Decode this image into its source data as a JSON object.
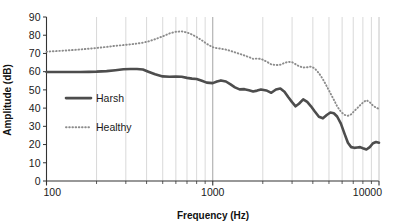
{
  "chart_data": {
    "type": "line",
    "title": "",
    "xlabel": "Frequency (Hz)",
    "ylabel": "Amplitude (dB)",
    "xscale": "log",
    "xlim": [
      100,
      10000
    ],
    "ylim": [
      0,
      90
    ],
    "ytick_step": 10,
    "yticks": [
      "0",
      "10",
      "20",
      "30",
      "40",
      "50",
      "60",
      "70",
      "80",
      "90"
    ],
    "xticks": [
      "100",
      "1000",
      "10000"
    ],
    "grid": "vertical-log-minor",
    "legend_position": "inside-left-middle",
    "series": [
      {
        "name": "Harsh",
        "style": "solid",
        "color": "#4d4d4d",
        "width": 2.6,
        "x": [
          100,
          120,
          140,
          160,
          180,
          200,
          230,
          260,
          290,
          320,
          350,
          380,
          410,
          450,
          500,
          550,
          600,
          650,
          700,
          750,
          800,
          860,
          920,
          1000,
          1060,
          1120,
          1200,
          1280,
          1360,
          1450,
          1550,
          1650,
          1750,
          1850,
          1950,
          2100,
          2250,
          2400,
          2550,
          2700,
          2850,
          3000,
          3150,
          3300,
          3500,
          3700,
          3900,
          4100,
          4350,
          4600,
          4850,
          5100,
          5350,
          5600,
          5900,
          6200,
          6500,
          6800,
          7100,
          7400,
          7700,
          8000,
          8400,
          8800,
          9200,
          9600,
          10000
        ],
        "y": [
          59.8,
          59.8,
          59.8,
          59.8,
          59.9,
          60.0,
          60.3,
          60.8,
          61.3,
          61.5,
          61.5,
          61.2,
          60.0,
          58.6,
          57.4,
          57.2,
          57.3,
          57.2,
          56.6,
          56.2,
          56.0,
          55.0,
          54.0,
          53.7,
          54.6,
          55.2,
          54.6,
          53.0,
          51.4,
          50.3,
          50.4,
          49.8,
          49.1,
          49.6,
          50.2,
          49.7,
          48.4,
          50.2,
          50.8,
          49.0,
          46.0,
          43.3,
          41.0,
          42.4,
          44.8,
          43.4,
          41.0,
          38.3,
          35.3,
          34.4,
          36.2,
          37.6,
          37.2,
          35.4,
          31.5,
          26.0,
          21.0,
          18.6,
          18.2,
          18.4,
          18.6,
          18.0,
          17.3,
          18.6,
          20.7,
          21.4,
          21.0
        ],
        "description": "Harsh voice spectrum, falls from ~60 dB at 100 Hz to ~18-21 dB above 6 kHz"
      },
      {
        "name": "Healthy",
        "style": "dotted",
        "color": "#8c8c8c",
        "width": 1.9,
        "x": [
          100,
          120,
          140,
          160,
          180,
          200,
          230,
          260,
          290,
          320,
          350,
          380,
          410,
          450,
          500,
          550,
          600,
          650,
          700,
          750,
          800,
          860,
          920,
          1000,
          1060,
          1120,
          1200,
          1280,
          1360,
          1450,
          1550,
          1650,
          1750,
          1850,
          1950,
          2100,
          2250,
          2400,
          2550,
          2700,
          2850,
          3000,
          3150,
          3300,
          3500,
          3700,
          3900,
          4100,
          4350,
          4600,
          4850,
          5100,
          5350,
          5600,
          5900,
          6200,
          6500,
          6800,
          7100,
          7400,
          7700,
          8000,
          8400,
          8800,
          9200,
          9600,
          10000
        ],
        "y": [
          71.0,
          71.4,
          71.8,
          72.2,
          72.6,
          73.0,
          73.6,
          74.2,
          74.6,
          75.0,
          75.4,
          75.9,
          76.6,
          77.8,
          79.4,
          81.0,
          81.9,
          82.1,
          81.5,
          80.4,
          79.0,
          77.2,
          75.3,
          73.4,
          72.9,
          72.6,
          72.1,
          71.4,
          70.6,
          69.8,
          68.9,
          68.0,
          67.0,
          67.2,
          67.0,
          65.6,
          64.0,
          63.6,
          63.8,
          64.8,
          65.4,
          65.2,
          64.1,
          63.0,
          62.3,
          62.4,
          62.8,
          61.8,
          59.2,
          55.8,
          52.0,
          48.2,
          44.6,
          41.0,
          38.0,
          36.3,
          35.8,
          36.6,
          38.4,
          40.0,
          41.6,
          43.0,
          44.4,
          43.2,
          41.4,
          40.2,
          39.6
        ],
        "description": "Healthy voice spectrum, peaks ~82 dB near 650 Hz, dips to ~36 dB near 6.5 kHz"
      }
    ]
  },
  "legend": {
    "items": [
      {
        "label": "Harsh",
        "style": "solid"
      },
      {
        "label": "Healthy",
        "style": "dotted"
      }
    ]
  },
  "colors": {
    "harsh": "#4d4d4d",
    "healthy": "#8c8c8c",
    "axis": "#333333",
    "grid": "#c8c8c8",
    "text": "#1a1a1a",
    "background": "#ffffff"
  }
}
